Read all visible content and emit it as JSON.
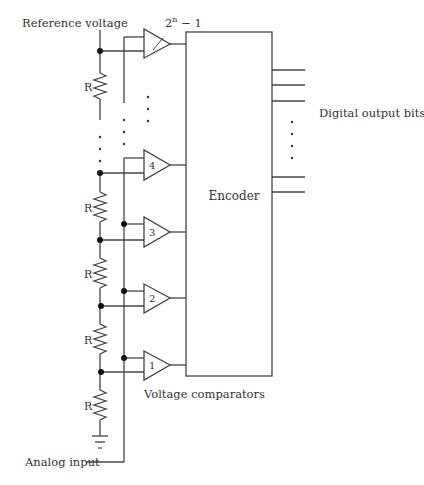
{
  "diagram": {
    "labels": {
      "reference_voltage": "Reference voltage",
      "top_comparator": "2",
      "top_comparator_sup": "n",
      "top_comparator_suffix": " − 1",
      "encoder": "Encoder",
      "digital_output": "Digital output bits",
      "voltage_comparators": "Voltage comparators",
      "analog_input": "Analog input",
      "resistor": "R"
    },
    "comparators": [
      {
        "id": "1",
        "label": "1"
      },
      {
        "id": "2",
        "label": "2"
      },
      {
        "id": "3",
        "label": "3"
      },
      {
        "id": "4",
        "label": "4"
      },
      {
        "id": "top",
        "label": "2^n − 1"
      }
    ],
    "resistor_count": 5,
    "output_lines_visible": 5,
    "colors": {
      "line": "#444444",
      "text": "#333333",
      "dot": "#111111"
    }
  }
}
